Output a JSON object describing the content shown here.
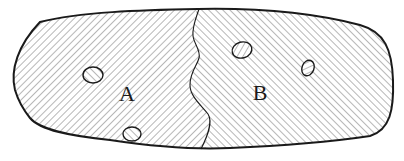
{
  "diagram": {
    "type": "two-region hatched body with inclusions",
    "colors": {
      "outline": "#1a1a1a",
      "hatch": "#7a7a7a",
      "background": "#ffffff"
    },
    "regions": [
      {
        "id": "A",
        "label": "A",
        "hatch_direction": "forward-slash",
        "label_pos": [
          127,
          94
        ]
      },
      {
        "id": "B",
        "label": "B",
        "hatch_direction": "back-slash",
        "label_pos": [
          260,
          93
        ]
      }
    ],
    "inclusions": [
      {
        "region": "A",
        "cx": 93,
        "cy": 75,
        "rx": 10,
        "ry": 8,
        "hatch_direction": "back-slash"
      },
      {
        "region": "A",
        "cx": 132,
        "cy": 134,
        "rx": 9,
        "ry": 7,
        "hatch_direction": "back-slash"
      },
      {
        "region": "B",
        "cx": 242,
        "cy": 50,
        "rx": 10,
        "ry": 8,
        "hatch_direction": "forward-slash"
      },
      {
        "region": "B",
        "cx": 308,
        "cy": 68,
        "rx": 6,
        "ry": 8,
        "hatch_direction": "forward-slash"
      }
    ]
  }
}
